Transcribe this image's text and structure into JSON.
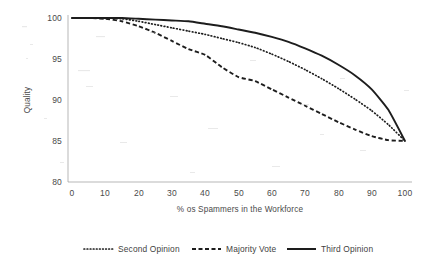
{
  "chart_data": {
    "type": "line",
    "title": "",
    "xlabel": "% os Spammers in the Workforce",
    "ylabel": "Quality",
    "xlim": [
      0,
      100
    ],
    "ylim": [
      80,
      100
    ],
    "grid": false,
    "legend_position": "bottom",
    "x_ticks": [
      "0",
      "10",
      "20",
      "30",
      "40",
      "50",
      "60",
      "70",
      "80",
      "90",
      "100"
    ],
    "y_ticks": [
      "80",
      "85",
      "90",
      "95",
      "100"
    ],
    "x": [
      0,
      5,
      10,
      15,
      20,
      25,
      30,
      35,
      40,
      45,
      50,
      55,
      60,
      65,
      70,
      75,
      80,
      85,
      90,
      95,
      100
    ],
    "series": [
      {
        "name": "Second Opinion",
        "style": "dotted",
        "color": "#1d1d1d",
        "values": [
          100,
          100,
          100,
          99.9,
          99.6,
          99.2,
          98.8,
          98.4,
          98.0,
          97.5,
          97.0,
          96.4,
          95.6,
          94.7,
          93.7,
          92.6,
          91.4,
          90.1,
          88.7,
          87.0,
          85.0
        ]
      },
      {
        "name": "Majority Vote",
        "style": "dashed",
        "color": "#1d1d1d",
        "values": [
          100,
          100,
          99.9,
          99.6,
          99.0,
          98.2,
          97.2,
          96.2,
          95.5,
          94.0,
          92.8,
          92.3,
          91.3,
          90.3,
          89.3,
          88.3,
          87.3,
          86.4,
          85.6,
          85.1,
          85.0
        ]
      },
      {
        "name": "Third Opinion",
        "style": "solid",
        "color": "#1d1d1d",
        "values": [
          100,
          100,
          100,
          100,
          99.9,
          99.8,
          99.7,
          99.6,
          99.3,
          99.0,
          98.6,
          98.2,
          97.7,
          97.1,
          96.3,
          95.4,
          94.3,
          93.0,
          91.3,
          88.8,
          85.0
        ]
      }
    ],
    "legend": [
      {
        "label": "Second Opinion",
        "style": "dotted"
      },
      {
        "label": "Majority Vote",
        "style": "dashed"
      },
      {
        "label": "Third Opinion",
        "style": "solid"
      }
    ]
  },
  "colors": {
    "ink": "#1d1d1d",
    "axis": "#9a9a9a",
    "text": "#4a4a4a",
    "background": "#ffffff"
  }
}
